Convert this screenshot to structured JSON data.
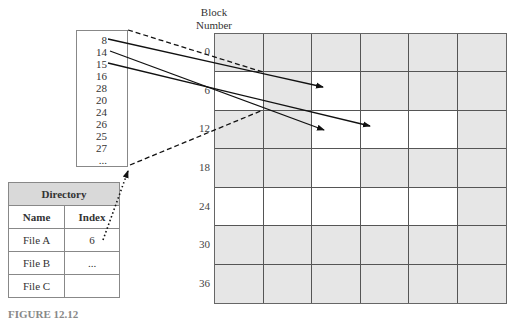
{
  "block_label": {
    "line1": "Block",
    "line2": "Number"
  },
  "grid": {
    "columns": 6,
    "rows": 7,
    "row_labels": [
      "0",
      "6",
      "12",
      "18",
      "24",
      "30",
      "36"
    ],
    "colors": {
      "used": "#e6e6e6",
      "free": "#ffffff"
    },
    "cells": [
      [
        "used",
        "used",
        "used",
        "used",
        "used",
        "used"
      ],
      [
        "free",
        "used",
        "free",
        "used",
        "used",
        "used"
      ],
      [
        "used",
        "used",
        "free",
        "free",
        "free",
        "used"
      ],
      [
        "used",
        "used",
        "free",
        "used",
        "used",
        "used"
      ],
      [
        "free",
        "free",
        "free",
        "free",
        "free",
        "used"
      ],
      [
        "used",
        "used",
        "used",
        "used",
        "used",
        "used"
      ],
      [
        "used",
        "used",
        "used",
        "used",
        "used",
        "used"
      ]
    ]
  },
  "index_block": {
    "entries": [
      "8",
      "14",
      "15",
      "16",
      "28",
      "20",
      "24",
      "26",
      "25",
      "27",
      "..."
    ]
  },
  "directory": {
    "title": "Directory",
    "headers": {
      "name": "Name",
      "index": "Index"
    },
    "rows": [
      {
        "name": "File A",
        "index": "6"
      },
      {
        "name": "File B",
        "index": "..."
      },
      {
        "name": "File C",
        "index": ""
      }
    ]
  },
  "caption": "FIGURE 12.12"
}
